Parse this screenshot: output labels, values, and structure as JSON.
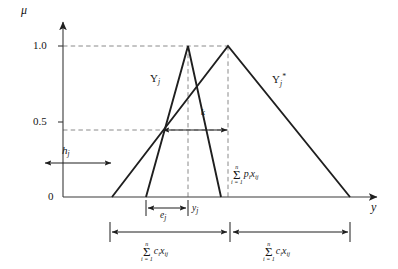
{
  "figure": {
    "type": "fuzzy-membership-diagram"
  },
  "axes": {
    "y_axis_label": "μ",
    "x_axis_label": "y",
    "y_ticks": [
      {
        "value": 1.0,
        "label": "1.0",
        "px_y": 46
      },
      {
        "value": 0.5,
        "label": "0.5",
        "px_y": 122
      },
      {
        "value": 0.0,
        "label": "0",
        "px_y": 197
      }
    ],
    "y_range": [
      0,
      1.08
    ],
    "origin_px": {
      "x": 63,
      "y": 197
    }
  },
  "curves": [
    {
      "name": "Y_j",
      "label_base": "Y",
      "label_sub": "j",
      "label_sup": "",
      "underbar": true,
      "label_px": {
        "x": 150,
        "y": 79
      },
      "points": [
        {
          "y": 146,
          "mu": 0.0
        },
        {
          "y": 188,
          "mu": 1.0
        },
        {
          "y": 221,
          "mu": 0.0
        }
      ]
    },
    {
      "name": "Y*_j",
      "label_base": "Y",
      "label_sub": "j",
      "label_sup": "*",
      "underbar": true,
      "label_px": {
        "x": 272,
        "y": 79
      },
      "points": [
        {
          "y": 112,
          "mu": 0.0
        },
        {
          "y": 228,
          "mu": 1.0
        },
        {
          "y": 350,
          "mu": 0.0
        }
      ]
    }
  ],
  "intersection": {
    "mu": 0.44,
    "px": {
      "x": 162,
      "y": 130
    }
  },
  "annotations": {
    "h_j": {
      "base": "h",
      "sub": "j",
      "kind": "vertical-double-arrow",
      "from_mu": 0.0,
      "to_mu": 0.44,
      "px": {
        "x": 78,
        "y_top": 130,
        "y_bottom": 196
      },
      "label_px": {
        "x": 64,
        "y": 152
      }
    },
    "k": {
      "base": "k",
      "sub": "",
      "kind": "horizontal-double-arrow",
      "px": {
        "y": 130,
        "x_left": 162,
        "x_right": 228
      },
      "label_px": {
        "x": 204,
        "y": 116
      }
    },
    "e_j": {
      "base": "e",
      "sub": "j",
      "kind": "horizontal-double-arrow",
      "px": {
        "y": 208,
        "x_left": 146,
        "x_right": 188
      },
      "label_px": {
        "x": 161,
        "y": 213
      }
    },
    "y_j": {
      "base": "y",
      "sub": "j",
      "kind": "text",
      "label_px": {
        "x": 192,
        "y": 206
      }
    },
    "sum_p": {
      "top": "n",
      "sigma": "Σ",
      "bottom": "i = 1",
      "expr": "p",
      "expr_sub1": "i",
      "expr_var": "x",
      "expr_sub2": "ij",
      "px": {
        "x": 231,
        "y": 170
      }
    },
    "sum_c_left": {
      "top": "n",
      "sigma": "Σ",
      "bottom": "i = 1",
      "expr": "c",
      "expr_sub1": "i",
      "expr_var": "x",
      "expr_sub2": "ij",
      "kind": "horizontal-double-arrow",
      "px": {
        "y": 232,
        "x_left": 110,
        "x_right": 228
      },
      "label_px": {
        "x": 169,
        "y": 248
      }
    },
    "sum_c_right": {
      "top": "n",
      "sigma": "Σ",
      "bottom": "i = 1",
      "expr": "c",
      "expr_sub1": "i",
      "expr_var": "x",
      "expr_sub2": "ij",
      "kind": "horizontal-double-arrow",
      "px": {
        "y": 232,
        "x_left": 232,
        "x_right": 350
      },
      "label_px": {
        "x": 291,
        "y": 248
      }
    }
  },
  "colors": {
    "stroke": "#1f1f1f",
    "dashed": "#7d7d7d",
    "background": "#ffffff",
    "text": "#151515"
  }
}
